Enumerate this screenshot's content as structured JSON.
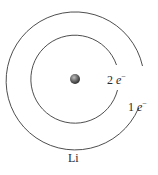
{
  "diagram": {
    "element_label": "Li",
    "inner_shell": {
      "count": "2",
      "particle": "e",
      "charge": "−"
    },
    "outer_shell": {
      "count": "1",
      "particle": "e",
      "charge": "−"
    },
    "colors": {
      "stroke": "#3a3a3a",
      "nucleus": "#555555",
      "text": "#2a2a2a"
    }
  }
}
